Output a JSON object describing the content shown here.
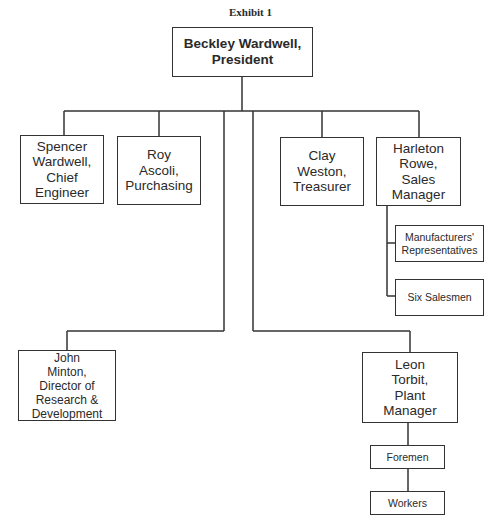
{
  "exhibit_title": "Exhibit 1",
  "nodes": {
    "president": "Beckley Wardwell,\nPresident",
    "chief_engineer": "Spencer\nWardwell,\nChief\nEngineer",
    "purchasing": "Roy\nAscoli,\nPurchasing",
    "treasurer": "Clay\nWeston,\nTreasurer",
    "sales_manager": "Harleton\nRowe,\nSales\nManager",
    "manufacturers_reps": "Manufacturers'\nRepresentatives",
    "salesmen": "Six Salesmen",
    "rnd_director": "John\nMinton,\nDirector of\nResearch &\nDevelopment",
    "plant_manager": "Leon\nTorbit,\nPlant\nManager",
    "foremen": "Foremen",
    "workers": "Workers"
  },
  "hierarchy": [
    {
      "parent": "president",
      "children": [
        "chief_engineer",
        "purchasing",
        "treasurer",
        "sales_manager",
        "rnd_director",
        "plant_manager"
      ]
    },
    {
      "parent": "sales_manager",
      "children": [
        "manufacturers_reps",
        "salesmen"
      ]
    },
    {
      "parent": "plant_manager",
      "children": [
        "foremen"
      ]
    },
    {
      "parent": "foremen",
      "children": [
        "workers"
      ]
    }
  ]
}
